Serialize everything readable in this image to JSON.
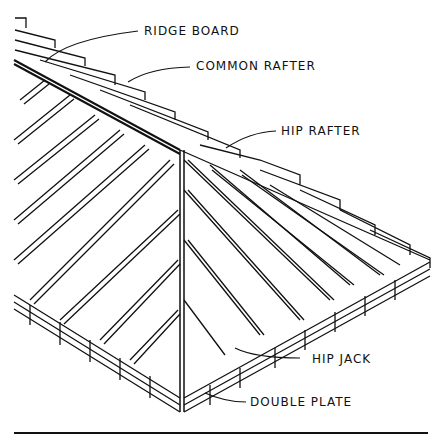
{
  "diagram": {
    "type": "hip roof framing",
    "labels": {
      "ridge_board": "RIDGE BOARD",
      "common_rafter": "COMMON RAFTER",
      "hip_rafter": "HIP RAFTER",
      "hip_jack": "HIP JACK",
      "double_plate": "DOUBLE PLATE"
    },
    "colors": {
      "line": "#111111",
      "background": "#ffffff"
    }
  }
}
